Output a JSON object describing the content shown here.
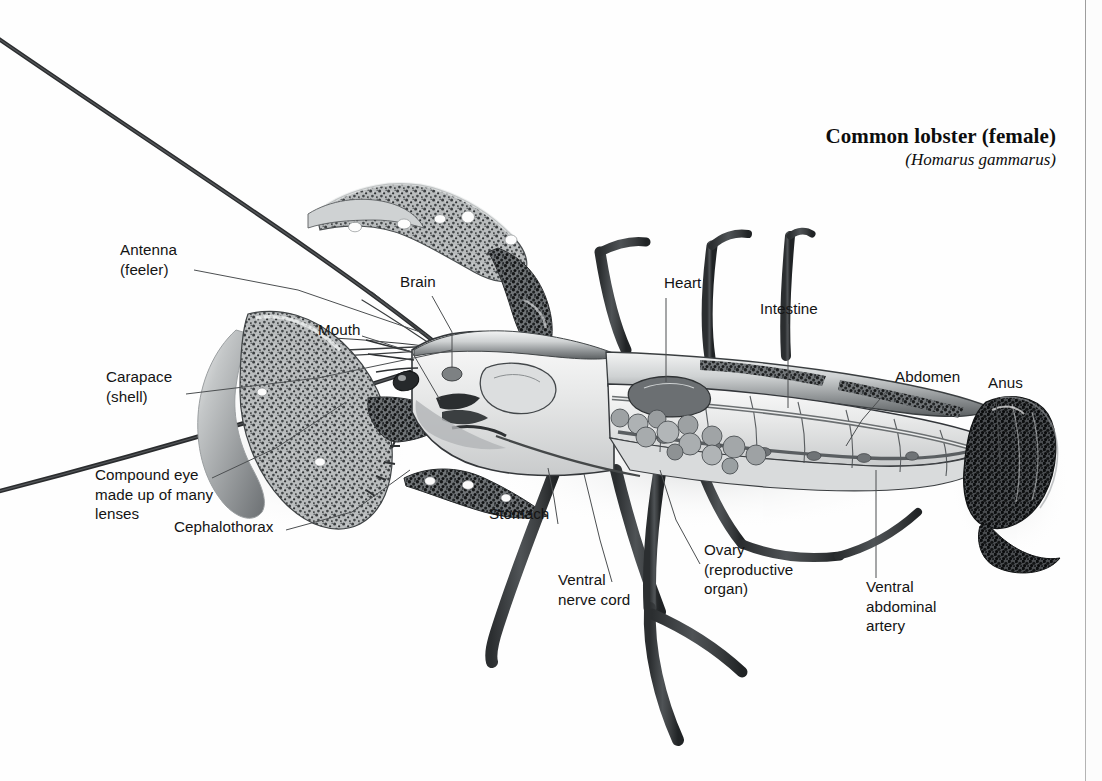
{
  "page": {
    "background_color": "#ffffff",
    "ink_color": "#141414",
    "rule_color": "#9d9d9d"
  },
  "title": {
    "common_name": "Common lobster (female)",
    "scientific_name": "(Homarus gammarus)"
  },
  "labels": [
    {
      "id": "antenna",
      "text": "Antenna\n(feeler)",
      "x": 120,
      "y": 248,
      "align": "left"
    },
    {
      "id": "brain",
      "text": "Brain",
      "x": 400,
      "y": 280,
      "align": "left"
    },
    {
      "id": "mouth",
      "text": "Mouth",
      "x": 318,
      "y": 328,
      "align": "left"
    },
    {
      "id": "carapace",
      "text": "Carapace\n(shell)",
      "x": 106,
      "y": 375,
      "align": "left"
    },
    {
      "id": "compound-eye",
      "text": "Compound eye\nmade up of many\nlenses",
      "x": 95,
      "y": 473,
      "align": "left"
    },
    {
      "id": "cephalothorax",
      "text": "Cephalothorax",
      "x": 174,
      "y": 524,
      "align": "left"
    },
    {
      "id": "heart",
      "text": "Heart",
      "x": 664,
      "y": 281,
      "align": "left"
    },
    {
      "id": "intestine",
      "text": "Intestine",
      "x": 760,
      "y": 307,
      "align": "left"
    },
    {
      "id": "abdomen",
      "text": "Abdomen",
      "x": 895,
      "y": 375,
      "align": "left"
    },
    {
      "id": "anus",
      "text": "Anus",
      "x": 988,
      "y": 381,
      "align": "left"
    },
    {
      "id": "stomach",
      "text": "Stomach",
      "x": 489,
      "y": 512,
      "align": "left"
    },
    {
      "id": "ovary",
      "text": "Ovary\n(reproductive\norgan)",
      "x": 704,
      "y": 548,
      "align": "left"
    },
    {
      "id": "ventral-nerve",
      "text": "Ventral\nnerve cord",
      "x": 558,
      "y": 578,
      "align": "left"
    },
    {
      "id": "ventral-artery",
      "text": "Ventral\nabdominal\nartery",
      "x": 866,
      "y": 585,
      "align": "left"
    }
  ],
  "specimen": {
    "name": "common-lobster-cutaway",
    "view": "lateral dissection, head to the left, tail to the right",
    "parts": [
      "long antennae crossing the frame diagonally",
      "large speckled claws (chelae)",
      "cephalothorax / carapace with cutaway window",
      "internal organs: brain, stomach, heart, ovary, intestine, ventral nerve cord, ventral abdominal artery",
      "segmented abdomen with dark mottled tail fan",
      "walking legs descending below the body"
    ]
  }
}
